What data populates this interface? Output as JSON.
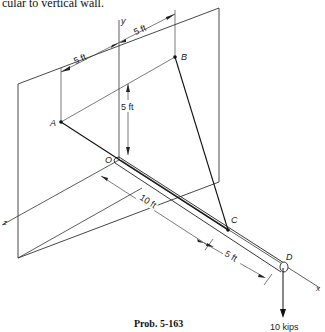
{
  "header_text": "cular to vertical wall.",
  "caption": "Prob. 5-163",
  "labels": {
    "axis_x": "x",
    "axis_y": "y",
    "axis_z": "z",
    "point_A": "A",
    "point_B": "B",
    "point_C": "C",
    "point_D": "D",
    "point_O": "O"
  },
  "dimensions": {
    "dim_A_to_y": "5 ft",
    "dim_y_to_B": "5 ft",
    "dim_vertical": "5 ft",
    "dim_O_to_C": "10 ft",
    "dim_C_to_D": "5 ft"
  },
  "load": "10 kips",
  "colors": {
    "line": "#222222",
    "background": "#ffffff"
  }
}
